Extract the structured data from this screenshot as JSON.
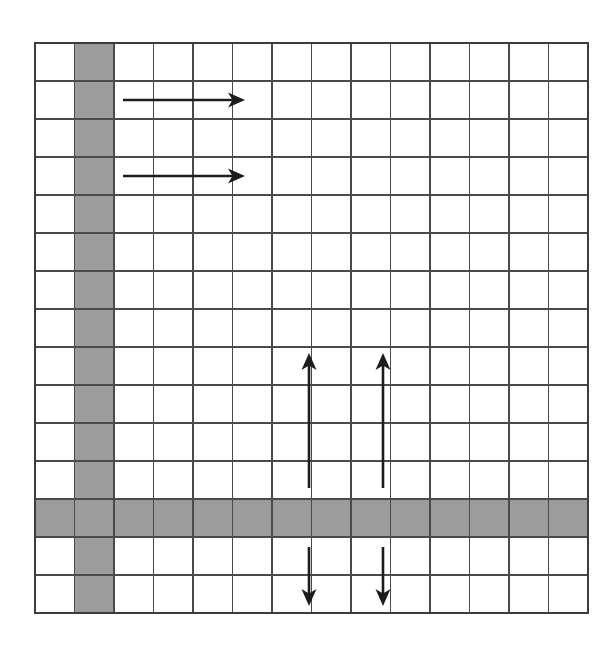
{
  "diagram": {
    "type": "grid-schematic",
    "canvas": {
      "width": 614,
      "height": 650,
      "background_color": "#ffffff"
    },
    "grid": {
      "columns": 14,
      "rows": 15,
      "origin_x": 35,
      "origin_y": 43,
      "cell_width": 39.5,
      "cell_height": 38.0,
      "line_color": "#4a4a4a",
      "outline_color": "#3d3d3d",
      "cell_fill_color": "#ffffff",
      "shaded_fill_color": "#9c9c9c",
      "shaded_column_indices": [
        1
      ],
      "shaded_row_indices": [
        12
      ],
      "shaded_column_label": "column-2",
      "shaded_row_label": "row-13"
    },
    "arrows": [
      {
        "name": "arrow-right-upper",
        "direction": "right",
        "color": "#1c1c1c",
        "x1": 123,
        "y1": 100,
        "x2": 245,
        "y2": 100
      },
      {
        "name": "arrow-right-lower",
        "direction": "right",
        "color": "#1c1c1c",
        "x1": 123,
        "y1": 176,
        "x2": 245,
        "y2": 176
      },
      {
        "name": "arrow-up-left",
        "direction": "up",
        "color": "#1c1c1c",
        "x1": 309,
        "y1": 488,
        "x2": 309,
        "y2": 353
      },
      {
        "name": "arrow-up-right",
        "direction": "up",
        "color": "#1c1c1c",
        "x1": 383,
        "y1": 488,
        "x2": 383,
        "y2": 353
      },
      {
        "name": "arrow-down-left",
        "direction": "down",
        "color": "#1c1c1c",
        "x1": 309,
        "y1": 547,
        "x2": 309,
        "y2": 606
      },
      {
        "name": "arrow-down-right",
        "direction": "down",
        "color": "#1c1c1c",
        "x1": 383,
        "y1": 547,
        "x2": 383,
        "y2": 606
      }
    ]
  }
}
